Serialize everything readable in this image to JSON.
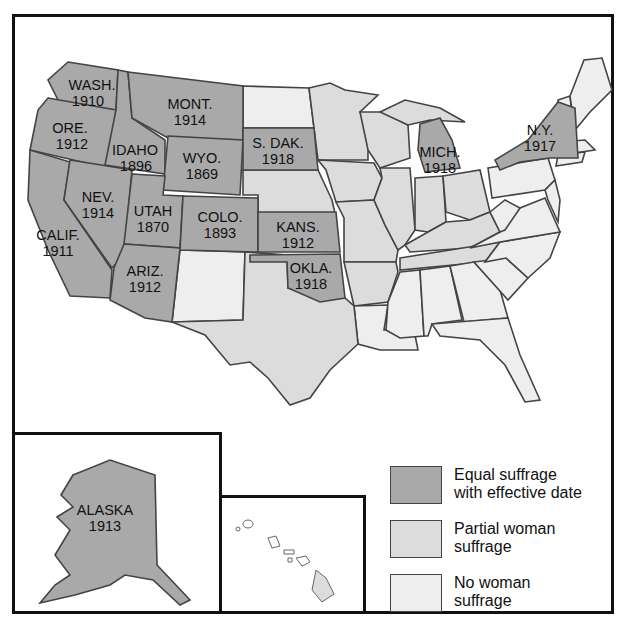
{
  "colors": {
    "equal": "#a9a9a9",
    "partial": "#dcdcdc",
    "none": "#eeeeee",
    "border": "#111111"
  },
  "states": {
    "wash": {
      "name": "WASH.",
      "year": "1910"
    },
    "ore": {
      "name": "ORE.",
      "year": "1912"
    },
    "calif": {
      "name": "CALIF.",
      "year": "1911"
    },
    "idaho": {
      "name": "IDAHO",
      "year": "1896"
    },
    "nev": {
      "name": "NEV.",
      "year": "1914"
    },
    "mont": {
      "name": "MONT.",
      "year": "1914"
    },
    "wyo": {
      "name": "WYO.",
      "year": "1869"
    },
    "utah": {
      "name": "UTAH",
      "year": "1870"
    },
    "ariz": {
      "name": "ARIZ.",
      "year": "1912"
    },
    "colo": {
      "name": "COLO.",
      "year": "1893"
    },
    "sdak": {
      "name": "S. DAK.",
      "year": "1918"
    },
    "kans": {
      "name": "KANS.",
      "year": "1912"
    },
    "okla": {
      "name": "OKLA.",
      "year": "1918"
    },
    "mich": {
      "name": "MICH.",
      "year": "1918"
    },
    "ny": {
      "name": "N.Y.",
      "year": "1917"
    },
    "alaska": {
      "name": "ALASKA",
      "year": "1913"
    }
  },
  "legend": [
    {
      "label": "Equal suffrage with effective date",
      "line1": "Equal suffrage",
      "line2": "with effective date",
      "color": "#a9a9a9"
    },
    {
      "label": "Partial woman suffrage",
      "line1": "Partial woman",
      "line2": "suffrage",
      "color": "#dcdcdc"
    },
    {
      "label": "No woman suffrage",
      "line1": "No woman",
      "line2": "suffrage",
      "color": "#eeeeee"
    }
  ]
}
